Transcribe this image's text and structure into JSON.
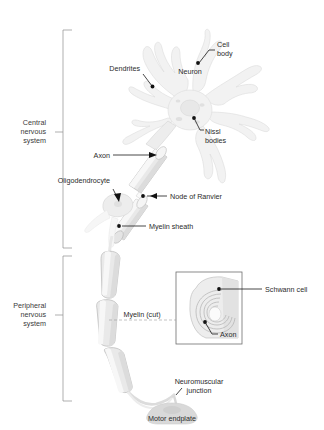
{
  "figure": {
    "background_color": "#ffffff",
    "label_color": "#2b2b2b",
    "leader_color": "#1a1a1a",
    "bracket_color": "#8c8c8c",
    "cell_fill_color": "#f2f2f2",
    "segment_fill_color": "#e9e9e9"
  },
  "groups": {
    "cns": {
      "line1": "Central",
      "line2": "nervous",
      "line3": "system"
    },
    "pns": {
      "line1": "Peripheral",
      "line2": "nervous",
      "line3": "system"
    }
  },
  "labels": {
    "cell_body_l1": "Cell",
    "cell_body_l2": "body",
    "neuron": "Neuron",
    "dendrites": "Dendrites",
    "nissl_l1": "Nissl",
    "nissl_l2": "bodies",
    "axon": "Axon",
    "oligodendrocyte": "Oligodendrocyte",
    "node_of_ranvier": "Node of Ranvier",
    "myelin_sheath": "Myelin sheath",
    "myelin_cut": "Myelin (cut)",
    "schwann_cell": "Schwann cell",
    "inset_axon": "Axon",
    "neuromuscular_l1": "Neuromuscular",
    "neuromuscular_l2": "junction",
    "motor_endplate": "Motor endplate"
  },
  "icons": {
    "leader_dot": "leader-dot-marker",
    "bracket": "group-bracket",
    "dashed_connector": "dashed-connector"
  }
}
